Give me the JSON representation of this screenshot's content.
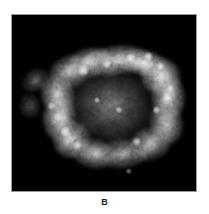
{
  "figure": {
    "caption_label": "B",
    "panel_background": "#ffffff",
    "plate_background": "#000000",
    "plate_border_color": "#9a9a9a",
    "plate": {
      "x": 11,
      "y": 14,
      "width": 186,
      "height": 178
    }
  },
  "chart_data": {
    "type": "heatmap",
    "title": "",
    "subtitle": "",
    "xlabel": "",
    "ylabel": "",
    "annotations": [
      "B"
    ],
    "legend": [],
    "grid": false,
    "colormap": "grayscale",
    "colormap_stops": [
      "#000000",
      "#3a3a3a",
      "#7a7a7a",
      "#b8b8b8",
      "#ffffff"
    ],
    "value_range": [
      0,
      1
    ],
    "axis_ticks": {
      "x": [],
      "y": []
    },
    "field": {
      "x_range": [
        0,
        186
      ],
      "y_range": [
        0,
        178
      ]
    },
    "emission_blobs": [
      {
        "cx": 104,
        "cy": 46,
        "rx": 34,
        "ry": 16,
        "rot": -8,
        "i": 0.52
      },
      {
        "cx": 132,
        "cy": 48,
        "rx": 26,
        "ry": 14,
        "rot": 10,
        "i": 0.6
      },
      {
        "cx": 150,
        "cy": 62,
        "rx": 22,
        "ry": 20,
        "rot": 20,
        "i": 0.66
      },
      {
        "cx": 158,
        "cy": 84,
        "rx": 18,
        "ry": 24,
        "rot": 0,
        "i": 0.58
      },
      {
        "cx": 156,
        "cy": 110,
        "rx": 18,
        "ry": 22,
        "rot": -15,
        "i": 0.5
      },
      {
        "cx": 140,
        "cy": 130,
        "rx": 24,
        "ry": 18,
        "rot": -20,
        "i": 0.46
      },
      {
        "cx": 112,
        "cy": 140,
        "rx": 28,
        "ry": 16,
        "rot": -5,
        "i": 0.4
      },
      {
        "cx": 82,
        "cy": 140,
        "rx": 24,
        "ry": 16,
        "rot": 12,
        "i": 0.44
      },
      {
        "cx": 60,
        "cy": 126,
        "rx": 20,
        "ry": 20,
        "rot": 25,
        "i": 0.56
      },
      {
        "cx": 48,
        "cy": 104,
        "rx": 18,
        "ry": 24,
        "rot": 5,
        "i": 0.6
      },
      {
        "cx": 46,
        "cy": 80,
        "rx": 18,
        "ry": 22,
        "rot": -12,
        "i": 0.52
      },
      {
        "cx": 58,
        "cy": 58,
        "rx": 22,
        "ry": 18,
        "rot": -25,
        "i": 0.46
      },
      {
        "cx": 78,
        "cy": 48,
        "rx": 24,
        "ry": 16,
        "rot": -15,
        "i": 0.48
      },
      {
        "cx": 100,
        "cy": 92,
        "rx": 46,
        "ry": 40,
        "rot": 0,
        "i": 0.26
      },
      {
        "cx": 24,
        "cy": 66,
        "rx": 16,
        "ry": 12,
        "rot": -30,
        "i": 0.22
      },
      {
        "cx": 18,
        "cy": 92,
        "rx": 12,
        "ry": 14,
        "rot": 0,
        "i": 0.16
      }
    ],
    "bright_knots": [
      {
        "cx": 72,
        "cy": 56,
        "r": 3.0,
        "i": 0.96
      },
      {
        "cx": 120,
        "cy": 44,
        "r": 2.6,
        "i": 0.92
      },
      {
        "cx": 138,
        "cy": 42,
        "r": 2.4,
        "i": 0.9
      },
      {
        "cx": 150,
        "cy": 52,
        "r": 2.2,
        "i": 0.88
      },
      {
        "cx": 96,
        "cy": 50,
        "r": 2.2,
        "i": 0.84
      },
      {
        "cx": 54,
        "cy": 118,
        "r": 2.6,
        "i": 0.86
      },
      {
        "cx": 66,
        "cy": 132,
        "r": 2.4,
        "i": 0.82
      },
      {
        "cx": 126,
        "cy": 128,
        "r": 2.2,
        "i": 0.8
      },
      {
        "cx": 146,
        "cy": 96,
        "r": 2.0,
        "i": 0.78
      },
      {
        "cx": 108,
        "cy": 96,
        "r": 1.8,
        "i": 0.74
      },
      {
        "cx": 86,
        "cy": 86,
        "r": 1.6,
        "i": 0.7
      },
      {
        "cx": 40,
        "cy": 92,
        "r": 2.0,
        "i": 0.72
      },
      {
        "cx": 160,
        "cy": 74,
        "r": 1.8,
        "i": 0.7
      },
      {
        "cx": 118,
        "cy": 158,
        "r": 1.6,
        "i": 0.52
      }
    ]
  }
}
